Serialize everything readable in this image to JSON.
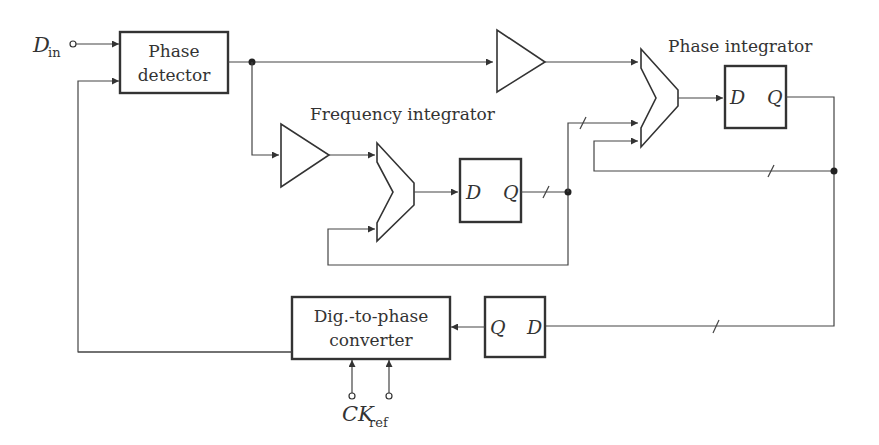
{
  "diagram": {
    "type": "ADPLL block diagram",
    "labels": {
      "din_main": "D",
      "din_sub": "in",
      "phase_detector_l1": "Phase",
      "phase_detector_l2": "detector",
      "frequency_integrator": "Frequency integrator",
      "phase_integrator": "Phase integrator",
      "dtp_l1": "Dig.-to-phase",
      "dtp_l2": "converter",
      "ckref_main": "CK",
      "ckref_sub": "ref",
      "d": "D",
      "q": "Q"
    },
    "blocks": [
      {
        "id": "phase-detector",
        "label": "Phase detector"
      },
      {
        "id": "gain-phase",
        "label": "amplifier"
      },
      {
        "id": "gain-frequency",
        "label": "amplifier"
      },
      {
        "id": "adder-frequency",
        "label": "adder"
      },
      {
        "id": "adder-phase",
        "label": "adder"
      },
      {
        "id": "dff-frequency",
        "label": "D Q"
      },
      {
        "id": "dff-phase",
        "label": "D Q"
      },
      {
        "id": "dff-output",
        "label": "Q D"
      },
      {
        "id": "dig-to-phase-converter",
        "label": "Dig.-to-phase converter"
      }
    ]
  }
}
